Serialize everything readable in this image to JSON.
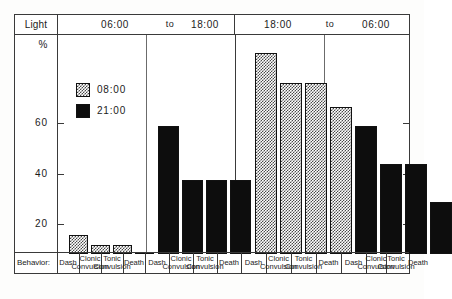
{
  "axes": {
    "row_header_label": "Light",
    "y_unit_label": "%",
    "y_ticks": [
      20,
      40,
      60
    ],
    "footer_label": "Behavior:"
  },
  "legend": {
    "entries": [
      {
        "label": "08:00",
        "pattern": "hatch"
      },
      {
        "label": "21:00",
        "pattern": "solid"
      }
    ]
  },
  "light_periods": [
    {
      "start": "06:00",
      "connector": "to",
      "end": "18:00"
    },
    {
      "start": "18:00",
      "connector": "to",
      "end": "06:00"
    }
  ],
  "chart_data": {
    "type": "bar",
    "title": "",
    "xlabel": "Behavior",
    "ylabel": "%",
    "ylim": [
      0,
      80
    ],
    "yticks": [
      20,
      40,
      60
    ],
    "grid": false,
    "legend_position": "inside-top-left",
    "categories": [
      "Dash",
      "Clonic Convulsion",
      "Tonic Convulsion",
      "Death"
    ],
    "groups": [
      {
        "light_period": "06:00 to 18:00",
        "series": "08:00",
        "pattern": "hatch",
        "values": [
          7,
          3,
          3,
          0.5
        ]
      },
      {
        "light_period": "06:00 to 18:00",
        "series": "21:00",
        "pattern": "solid",
        "values": [
          47,
          27,
          27,
          27
        ]
      },
      {
        "light_period": "18:00 to 06:00",
        "series": "08:00",
        "pattern": "hatch",
        "values": [
          74,
          63,
          63,
          54
        ]
      },
      {
        "light_period": "18:00 to 06:00",
        "series": "21:00",
        "pattern": "solid",
        "values": [
          47,
          33,
          33,
          19
        ]
      }
    ]
  }
}
